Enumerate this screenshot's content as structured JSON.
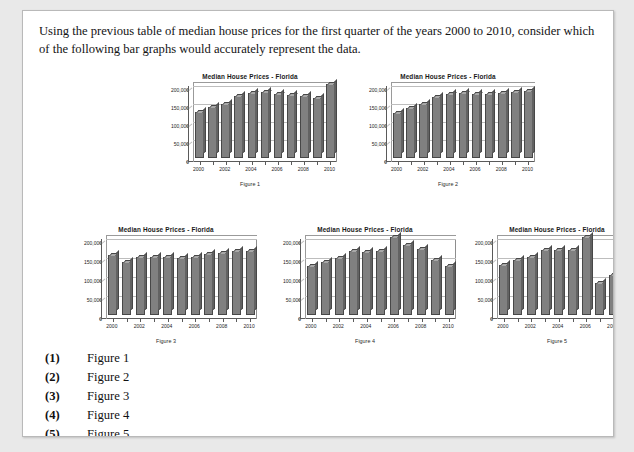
{
  "prompt": {
    "text": "Using the previous table of median house prices for the first quarter of the years 2000 to 2010, consider which of the following bar graphs would accurately represent the data."
  },
  "answers": {
    "options": [
      {
        "num": "(1)",
        "label": "Figure 1"
      },
      {
        "num": "(2)",
        "label": "Figure 2"
      },
      {
        "num": "(3)",
        "label": "Figure 3"
      },
      {
        "num": "(4)",
        "label": "Figure 4"
      },
      {
        "num": "(5)",
        "label": "Figure 5"
      }
    ]
  },
  "chart_data": [
    {
      "type": "bar",
      "title": "Median House Prices - Florida",
      "caption": "Figure 1",
      "xlabel": "",
      "ylabel": "",
      "categories": [
        "2000",
        "2001",
        "2002",
        "2003",
        "2004",
        "2005",
        "2006",
        "2007",
        "2008",
        "2009",
        "2010"
      ],
      "tick_labels": [
        "2000",
        "",
        "2002",
        "",
        "2004",
        "",
        "2006",
        "",
        "2008",
        "",
        "2010"
      ],
      "values": [
        128000,
        142000,
        150000,
        170000,
        180000,
        182000,
        176000,
        173000,
        172000,
        167000,
        205000
      ],
      "ytick_labels": [
        "0",
        "50,000",
        "100,000",
        "150,000",
        "200,000"
      ],
      "ytick_values": [
        0,
        50000,
        100000,
        150000,
        200000
      ],
      "ylim": [
        0,
        210000
      ],
      "grid": true,
      "legend": "none",
      "bar_color": "#808080"
    },
    {
      "type": "bar",
      "title": "Median House Prices - Florida",
      "caption": "Figure 2",
      "xlabel": "",
      "ylabel": "",
      "categories": [
        "2000",
        "2001",
        "2002",
        "2003",
        "2004",
        "2005",
        "2006",
        "2007",
        "2008",
        "2009",
        "2010"
      ],
      "tick_labels": [
        "2000",
        "",
        "2002",
        "",
        "2004",
        "",
        "2006",
        "",
        "2008",
        "",
        "2010"
      ],
      "values": [
        125000,
        137000,
        148000,
        168000,
        178000,
        180000,
        178000,
        177000,
        180000,
        182000,
        184000
      ],
      "ytick_labels": [
        "0",
        "50,000",
        "100,000",
        "150,000",
        "200,000"
      ],
      "ytick_values": [
        0,
        50000,
        100000,
        150000,
        200000
      ],
      "ylim": [
        0,
        210000
      ],
      "grid": true,
      "legend": "none",
      "bar_color": "#808080"
    },
    {
      "type": "bar",
      "title": "Median House Prices - Florida",
      "caption": "Figure 3",
      "xlabel": "",
      "ylabel": "",
      "categories": [
        "2000",
        "2001",
        "2002",
        "2003",
        "2004",
        "2005",
        "2006",
        "2007",
        "2008",
        "2009",
        "2010"
      ],
      "tick_labels": [
        "2000",
        "",
        "2002",
        "",
        "2004",
        "",
        "2006",
        "",
        "2008",
        "",
        "2010"
      ],
      "values": [
        157000,
        140000,
        152000,
        152000,
        151000,
        150000,
        152000,
        160000,
        163000,
        168000,
        168000
      ],
      "ytick_labels": [
        "0",
        "50,000",
        "100,000",
        "150,000",
        "200,000"
      ],
      "ytick_values": [
        0,
        50000,
        100000,
        150000,
        200000
      ],
      "ylim": [
        0,
        210000
      ],
      "grid": true,
      "legend": "none",
      "bar_color": "#808080"
    },
    {
      "type": "bar",
      "title": "Median House Prices - Florida",
      "caption": "Figure 4",
      "xlabel": "",
      "ylabel": "",
      "categories": [
        "2000",
        "2001",
        "2002",
        "2003",
        "2004",
        "2005",
        "2006",
        "2007",
        "2008",
        "2009",
        "2010"
      ],
      "tick_labels": [
        "2000",
        "",
        "2002",
        "",
        "2004",
        "",
        "2006",
        "",
        "2008",
        "",
        "2010"
      ],
      "values": [
        128000,
        140000,
        150000,
        168000,
        166000,
        168000,
        205000,
        185000,
        172000,
        145000,
        128000
      ],
      "ytick_labels": [
        "0",
        "50,000",
        "100,000",
        "150,000",
        "200,000"
      ],
      "ytick_values": [
        0,
        50000,
        100000,
        150000,
        200000
      ],
      "ylim": [
        0,
        210000
      ],
      "grid": true,
      "legend": "none",
      "bar_color": "#808080"
    },
    {
      "type": "bar",
      "title": "Median House Prices - Florida",
      "caption": "Figure 5",
      "xlabel": "",
      "ylabel": "",
      "categories": [
        "2000",
        "2001",
        "2002",
        "2003",
        "2004",
        "2005",
        "2006",
        "2007",
        "2008",
        "2009",
        "2010"
      ],
      "tick_labels": [
        "2000",
        "",
        "2002",
        "",
        "2004",
        "",
        "2006",
        "",
        "2008",
        "",
        "2010"
      ],
      "values": [
        130000,
        145000,
        152000,
        170000,
        170000,
        170000,
        205000,
        85000,
        105000,
        160000,
        140000
      ],
      "ytick_labels": [
        "0",
        "50,000",
        "100,000",
        "150,000",
        "200,000"
      ],
      "ytick_values": [
        0,
        50000,
        100000,
        150000,
        200000
      ],
      "ylim": [
        0,
        210000
      ],
      "grid": true,
      "legend": "none",
      "bar_color": "#808080"
    }
  ],
  "figure_layout": [
    {
      "left": 135,
      "top": 62,
      "plot_w": 148,
      "plot_h": 76,
      "label_w": 30
    },
    {
      "left": 333,
      "top": 62,
      "plot_w": 148,
      "plot_h": 76,
      "label_w": 30
    },
    {
      "left": 47,
      "top": 215,
      "plot_w": 155,
      "plot_h": 80,
      "label_w": 31
    },
    {
      "left": 246,
      "top": 215,
      "plot_w": 155,
      "plot_h": 80,
      "label_w": 31
    },
    {
      "left": 438,
      "top": 215,
      "plot_w": 155,
      "plot_h": 80,
      "label_w": 31
    }
  ]
}
